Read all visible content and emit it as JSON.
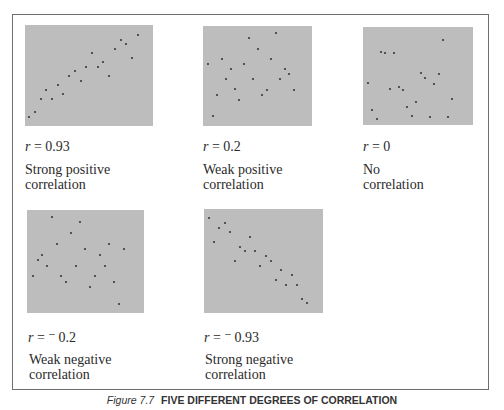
{
  "chart_data": [
    {
      "type": "scatter",
      "title": "r = 0.93",
      "r_symbol": "r",
      "r_value": "0.93",
      "description": [
        "Strong positive",
        "correlation"
      ],
      "box": {
        "x": 25,
        "y": 25,
        "w": 128,
        "h": 101
      },
      "points": [
        [
          29,
          117
        ],
        [
          35,
          112
        ],
        [
          41,
          99
        ],
        [
          46,
          90
        ],
        [
          52,
          99
        ],
        [
          58,
          85
        ],
        [
          63,
          94
        ],
        [
          69,
          76
        ],
        [
          75,
          71
        ],
        [
          81,
          81
        ],
        [
          86,
          67
        ],
        [
          92,
          53
        ],
        [
          98,
          67
        ],
        [
          103,
          62
        ],
        [
          109,
          76
        ],
        [
          115,
          49
        ],
        [
          121,
          40
        ],
        [
          126,
          44
        ],
        [
          132,
          58
        ],
        [
          138,
          35
        ]
      ]
    },
    {
      "type": "scatter",
      "title": "r = 0.2",
      "r_symbol": "r",
      "r_value": "0.2",
      "description": [
        "Weak positive",
        "correlation"
      ],
      "box": {
        "x": 203,
        "y": 26,
        "w": 109,
        "h": 100
      },
      "points": [
        [
          208,
          64
        ],
        [
          213,
          116
        ],
        [
          217,
          95
        ],
        [
          222,
          59
        ],
        [
          226,
          79
        ],
        [
          231,
          69
        ],
        [
          235,
          89
        ],
        [
          239,
          100
        ],
        [
          244,
          64
        ],
        [
          249,
          38
        ],
        [
          253,
          79
        ],
        [
          258,
          49
        ],
        [
          262,
          95
        ],
        [
          267,
          90
        ],
        [
          271,
          59
        ],
        [
          276,
          33
        ],
        [
          280,
          79
        ],
        [
          285,
          69
        ],
        [
          289,
          74
        ],
        [
          294,
          90
        ]
      ]
    },
    {
      "type": "scatter",
      "title": "r = 0",
      "r_symbol": "r",
      "r_value": "0",
      "description": [
        "No",
        "correlation"
      ],
      "box": {
        "x": 363,
        "y": 27,
        "w": 110,
        "h": 98
      },
      "points": [
        [
          368,
          83
        ],
        [
          372,
          110
        ],
        [
          377,
          119
        ],
        [
          381,
          52
        ],
        [
          385,
          53
        ],
        [
          390,
          89
        ],
        [
          394,
          53
        ],
        [
          399,
          87
        ],
        [
          403,
          90
        ],
        [
          407,
          107
        ],
        [
          412,
          116
        ],
        [
          416,
          102
        ],
        [
          421,
          73
        ],
        [
          425,
          78
        ],
        [
          430,
          117
        ],
        [
          434,
          84
        ],
        [
          439,
          74
        ],
        [
          443,
          40
        ],
        [
          448,
          117
        ],
        [
          452,
          99
        ]
      ]
    },
    {
      "type": "scatter",
      "title": "r = −0.2",
      "r_symbol": "r",
      "r_value": "⁻0.2",
      "description": [
        "Weak negative",
        "correlation"
      ],
      "box": {
        "x": 27,
        "y": 210,
        "w": 117,
        "h": 103
      },
      "points": [
        [
          33,
          276
        ],
        [
          38,
          260
        ],
        [
          42,
          255
        ],
        [
          47,
          266
        ],
        [
          52,
          217
        ],
        [
          57,
          244
        ],
        [
          61,
          276
        ],
        [
          66,
          282
        ],
        [
          71,
          233
        ],
        [
          76,
          266
        ],
        [
          80,
          222
        ],
        [
          85,
          249
        ],
        [
          90,
          287
        ],
        [
          95,
          276
        ],
        [
          100,
          255
        ],
        [
          105,
          266
        ],
        [
          109,
          244
        ],
        [
          114,
          282
        ],
        [
          119,
          304
        ],
        [
          124,
          249
        ]
      ]
    },
    {
      "type": "scatter",
      "title": "r = −0.93",
      "r_symbol": "r",
      "r_value": "⁻0.93",
      "description": [
        "Strong negative",
        "correlation"
      ],
      "box": {
        "x": 204,
        "y": 209,
        "w": 119,
        "h": 104
      },
      "points": [
        [
          209,
          218
        ],
        [
          214,
          242
        ],
        [
          219,
          228
        ],
        [
          225,
          223
        ],
        [
          230,
          232
        ],
        [
          235,
          261
        ],
        [
          240,
          247
        ],
        [
          245,
          251
        ],
        [
          250,
          237
        ],
        [
          255,
          251
        ],
        [
          260,
          266
        ],
        [
          266,
          256
        ],
        [
          271,
          261
        ],
        [
          276,
          280
        ],
        [
          281,
          270
        ],
        [
          286,
          285
        ],
        [
          292,
          275
        ],
        [
          297,
          285
        ],
        [
          302,
          299
        ],
        [
          307,
          303
        ]
      ]
    }
  ],
  "labels": [
    {
      "r": "r",
      "eq": " = ",
      "val": "0.93",
      "line1": "Strong positive",
      "line2": "correlation"
    },
    {
      "r": "r",
      "eq": " = ",
      "val": "0.2",
      "line1": "Weak positive",
      "line2": "correlation"
    },
    {
      "r": "r",
      "eq": " = ",
      "val": "0",
      "line1": "No",
      "line2": "correlation"
    },
    {
      "r": "r",
      "eq": " = ",
      "val": "⁻ 0.2",
      "line1": "Weak negative",
      "line2": "correlation"
    },
    {
      "r": "r",
      "eq": " = ",
      "val": "⁻ 0.93",
      "line1": "Strong negative",
      "line2": "correlation"
    }
  ],
  "caption": {
    "figure": "Figure 7.7",
    "title": "FIVE DIFFERENT DEGREES OF CORRELATION"
  },
  "colors": {
    "plot_bg": "#bdbdbd",
    "dot": "#3a3a3a",
    "frame": "#6e6e6e"
  }
}
